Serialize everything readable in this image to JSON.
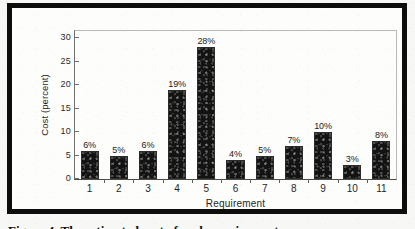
{
  "figure": {
    "frame_color": "#0d0d0d",
    "background_color": "#fdfdfc",
    "caption_partial": "Figure 4. The estimated cost of each requirement"
  },
  "chart_data": {
    "type": "bar",
    "title": "",
    "xlabel": "Requirement",
    "ylabel": "Cost (percent)",
    "categories": [
      "1",
      "2",
      "3",
      "4",
      "5",
      "6",
      "7",
      "8",
      "9",
      "10",
      "11"
    ],
    "values": [
      6,
      5,
      6,
      19,
      28,
      4,
      5,
      7,
      10,
      3,
      8
    ],
    "data_labels": [
      "6%",
      "5%",
      "6%",
      "19%",
      "28%",
      "4%",
      "5%",
      "7%",
      "10%",
      "3%",
      "8%"
    ],
    "ylim": [
      0,
      31.5
    ],
    "yticks": [
      0,
      5,
      10,
      15,
      20,
      25,
      30
    ],
    "ytick_labels": [
      "0",
      "5",
      "10",
      "15",
      "20",
      "25",
      "30"
    ],
    "grid": false,
    "legend": false,
    "bar_color": "#131313"
  }
}
